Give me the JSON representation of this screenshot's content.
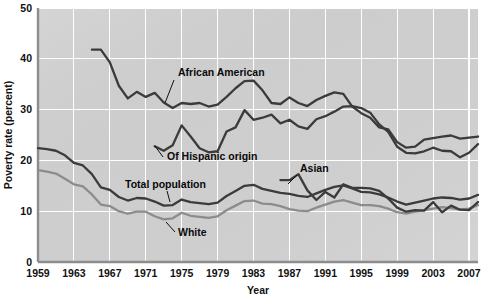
{
  "chart_data": {
    "type": "line",
    "title": "",
    "xlabel": "Year",
    "ylabel": "Poverty rate (percent)",
    "xlim": [
      1959,
      2008
    ],
    "ylim": [
      0,
      50
    ],
    "yticks": [
      0,
      10,
      20,
      30,
      40,
      50
    ],
    "xticks": [
      1959,
      1963,
      1967,
      1971,
      1975,
      1979,
      1983,
      1987,
      1991,
      1995,
      1999,
      2003,
      2007
    ],
    "grid": true,
    "legend_position": "inline-annotations",
    "plot_background": "#d2d2d2",
    "x": [
      1959,
      1960,
      1961,
      1962,
      1963,
      1964,
      1965,
      1966,
      1967,
      1968,
      1969,
      1970,
      1971,
      1972,
      1973,
      1974,
      1975,
      1976,
      1977,
      1978,
      1979,
      1980,
      1981,
      1982,
      1983,
      1984,
      1985,
      1986,
      1987,
      1988,
      1989,
      1990,
      1991,
      1992,
      1993,
      1994,
      1995,
      1996,
      1997,
      1998,
      1999,
      2000,
      2001,
      2002,
      2003,
      2004,
      2005,
      2006,
      2007,
      2008
    ],
    "series": [
      {
        "name": "Total population",
        "color": "#3b3b3b",
        "values": [
          22.4,
          22.2,
          21.9,
          21.0,
          19.5,
          19.0,
          17.3,
          14.7,
          14.2,
          12.8,
          12.1,
          12.6,
          12.5,
          11.9,
          11.1,
          11.2,
          12.3,
          11.8,
          11.6,
          11.4,
          11.7,
          13.0,
          14.0,
          15.0,
          15.2,
          14.4,
          14.0,
          13.6,
          13.4,
          13.0,
          12.8,
          13.5,
          14.2,
          14.8,
          15.1,
          14.5,
          13.8,
          13.7,
          13.3,
          12.7,
          11.9,
          11.3,
          11.7,
          12.1,
          12.5,
          12.7,
          12.6,
          12.3,
          12.5,
          13.2
        ]
      },
      {
        "name": "White",
        "color": "#8c8c8c",
        "values": [
          18.1,
          17.8,
          17.4,
          16.4,
          15.3,
          14.9,
          13.3,
          11.3,
          11.0,
          10.0,
          9.5,
          9.9,
          9.9,
          9.0,
          8.4,
          8.6,
          9.7,
          9.1,
          8.9,
          8.7,
          9.0,
          10.2,
          11.1,
          12.0,
          12.1,
          11.5,
          11.4,
          11.0,
          10.4,
          10.1,
          10.0,
          10.7,
          11.3,
          11.9,
          12.2,
          11.7,
          11.2,
          11.2,
          11.0,
          10.5,
          9.8,
          9.5,
          9.9,
          10.2,
          10.5,
          10.8,
          10.6,
          10.3,
          10.5,
          11.2
        ]
      },
      {
        "name": "African American",
        "color": "#3b3b3b",
        "values": [
          null,
          null,
          null,
          null,
          null,
          null,
          41.8,
          41.8,
          39.3,
          34.7,
          32.2,
          33.5,
          32.5,
          33.3,
          31.4,
          30.3,
          31.3,
          31.1,
          31.3,
          30.6,
          31.0,
          32.5,
          34.2,
          35.6,
          35.7,
          33.8,
          31.3,
          31.1,
          32.4,
          31.3,
          30.7,
          31.9,
          32.7,
          33.4,
          33.1,
          30.6,
          29.3,
          28.4,
          26.5,
          26.1,
          23.6,
          22.5,
          22.7,
          24.1,
          24.4,
          24.7,
          24.9,
          24.3,
          24.5,
          24.7
        ]
      },
      {
        "name": "Of Hispanic origin",
        "color": "#3b3b3b",
        "values": [
          null,
          null,
          null,
          null,
          null,
          null,
          null,
          null,
          null,
          null,
          null,
          null,
          null,
          22.8,
          21.9,
          23.0,
          26.9,
          24.7,
          22.4,
          21.6,
          21.8,
          25.7,
          26.5,
          29.9,
          28.0,
          28.4,
          29.0,
          27.3,
          28.0,
          26.7,
          26.2,
          28.1,
          28.7,
          29.6,
          30.6,
          30.7,
          30.3,
          29.4,
          27.1,
          25.6,
          22.7,
          21.5,
          21.4,
          21.8,
          22.5,
          21.9,
          21.8,
          20.6,
          21.5,
          23.2
        ]
      },
      {
        "name": "Asian",
        "color": "#3b3b3b",
        "values": [
          null,
          null,
          null,
          null,
          null,
          null,
          null,
          null,
          null,
          null,
          null,
          null,
          null,
          null,
          null,
          null,
          null,
          null,
          null,
          null,
          null,
          null,
          null,
          null,
          null,
          null,
          null,
          16.1,
          16.1,
          17.3,
          14.1,
          12.2,
          13.8,
          12.7,
          15.3,
          14.6,
          14.6,
          14.5,
          14.0,
          12.5,
          10.7,
          9.9,
          10.2,
          10.1,
          11.8,
          9.8,
          11.1,
          10.3,
          10.2,
          11.8
        ]
      }
    ],
    "annotations": [
      {
        "text": "African American",
        "x_px": 178,
        "y_px": 76,
        "leader": {
          "x1": 174,
          "y1": 80,
          "x2": 165,
          "y2": 103
        }
      },
      {
        "text": "Of Hispanic origin",
        "x_px": 167,
        "y_px": 160,
        "leader": {
          "x1": 163,
          "y1": 157,
          "x2": 155,
          "y2": 146
        }
      },
      {
        "text": "Total population",
        "x_px": 125,
        "y_px": 188,
        "leader": {
          "x1": 167,
          "y1": 191,
          "x2": 170,
          "y2": 202
        }
      },
      {
        "text": "White",
        "x_px": 178,
        "y_px": 236,
        "leader": {
          "x1": 175,
          "y1": 232,
          "x2": 166,
          "y2": 222
        }
      },
      {
        "text": "Asian",
        "x_px": 300,
        "y_px": 172,
        "leader": {
          "x1": 297,
          "y1": 175,
          "x2": 288,
          "y2": 184
        }
      }
    ]
  }
}
